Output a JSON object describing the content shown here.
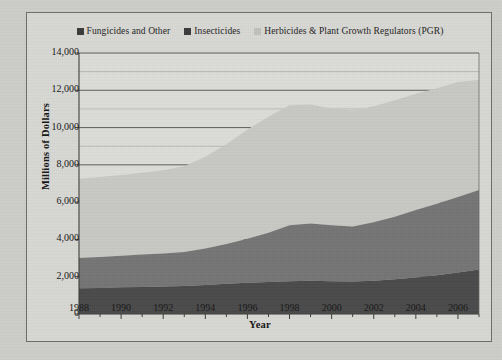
{
  "chart_data": {
    "type": "area",
    "stacked": true,
    "title": "",
    "xlabel": "Year",
    "ylabel": "Millions of Dollars",
    "x": [
      1988,
      1989,
      1990,
      1991,
      1992,
      1993,
      1994,
      1995,
      1996,
      1997,
      1998,
      1999,
      2000,
      2001,
      2002,
      2003,
      2004,
      2005,
      2006,
      2007
    ],
    "xlim": [
      1988,
      2007
    ],
    "ylim": [
      0,
      14000
    ],
    "yticks": [
      0,
      2000,
      4000,
      6000,
      8000,
      10000,
      12000,
      14000
    ],
    "ytick_labels": [
      "0",
      "2,000",
      "4,000",
      "6,000",
      "8,000",
      "10,000",
      "12,000",
      "14,000"
    ],
    "y_minor_gridlines": [
      1000,
      3000,
      5000,
      7000,
      9000,
      11000,
      13000
    ],
    "xticks": [
      1988,
      1990,
      1992,
      1994,
      1996,
      1998,
      2000,
      2002,
      2004,
      2006
    ],
    "xtick_labels": [
      "1988",
      "1990",
      "1992",
      "1994",
      "1996",
      "1998",
      "2000",
      "2002",
      "2004",
      "2006"
    ],
    "grid": true,
    "legend_position": "top",
    "series": [
      {
        "name": "Fungicides and Other",
        "color": "#4a4a4a",
        "values": [
          1380,
          1400,
          1430,
          1450,
          1470,
          1500,
          1560,
          1620,
          1680,
          1720,
          1760,
          1780,
          1760,
          1740,
          1780,
          1860,
          1960,
          2080,
          2230,
          2390
        ]
      },
      {
        "name": "Insecticides",
        "color": "#757575",
        "values": [
          1630,
          1660,
          1700,
          1740,
          1770,
          1820,
          1960,
          2130,
          2360,
          2640,
          3000,
          3080,
          3000,
          2950,
          3140,
          3360,
          3620,
          3830,
          4040,
          4260
        ]
      },
      {
        "name": "Herbicides & Plant Growth Regulators (PGR)",
        "color": "#c8c8c4",
        "values": [
          4240,
          4290,
          4330,
          4380,
          4470,
          4610,
          4910,
          5360,
          5850,
          6220,
          6440,
          6380,
          6260,
          6230,
          6230,
          6240,
          6230,
          6200,
          6170,
          5900
        ]
      }
    ],
    "totals": [
      7250,
      7350,
      7460,
      7570,
      7710,
      7930,
      8430,
      9110,
      9890,
      10580,
      11200,
      11240,
      11020,
      10920,
      11150,
      11460,
      11810,
      12110,
      12440,
      12550
    ]
  },
  "legend": {
    "entries": [
      {
        "label": "Fungicides and Other",
        "color": "#3a3a3a"
      },
      {
        "label": "Insecticides",
        "color": "#3a3a3a"
      },
      {
        "label": "Herbicides & Plant Growth Regulators (PGR)",
        "color": "#c0c0bc"
      }
    ]
  },
  "axes": {
    "y_title": "Millions of Dollars",
    "x_title": "Year"
  }
}
